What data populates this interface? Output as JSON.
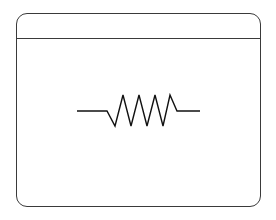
{
  "panel": {
    "title": "",
    "border_color": "#3a3a3a"
  },
  "symbol": {
    "name": "resistor",
    "icon": "resistor-icon",
    "stroke_color": "#111111",
    "points": "77,111 107,111 115,126 123,95 131,126 139,95 147,126 155,95 163,126 170,95 177,111 200,111"
  }
}
